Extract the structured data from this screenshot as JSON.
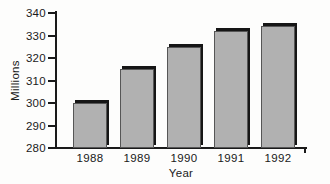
{
  "chart_data": {
    "type": "bar",
    "title": "",
    "categories": [
      "1988",
      "1989",
      "1990",
      "1991",
      "1992"
    ],
    "values": [
      300,
      315,
      325,
      332,
      334
    ],
    "xlabel": "Year",
    "ylabel": "Millions",
    "ylim": [
      280,
      340
    ],
    "yticks": [
      280,
      290,
      300,
      310,
      320,
      330,
      340
    ],
    "grid": false,
    "legend": "none",
    "bar_fill_color": "#b1b1b1",
    "bar_edge_color": "#565656",
    "bar_shadow_color": "#161616",
    "axis_color": "#1a1a1a",
    "text_color": "#1a1a1a",
    "background_color": "#fdfdfc"
  }
}
